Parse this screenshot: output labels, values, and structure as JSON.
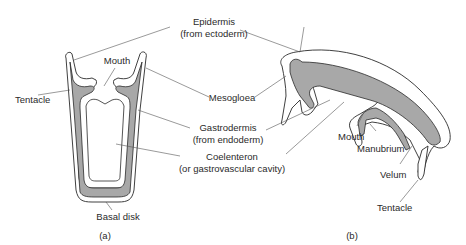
{
  "figure": {
    "panel_a": {
      "caption": "(a)",
      "labels": {
        "tentacle": "Tentacle",
        "mouth": "Mouth",
        "basal_disk": "Basal disk"
      }
    },
    "panel_b": {
      "caption": "(b)",
      "labels": {
        "mouth": "Mouth",
        "manubrium": "Manubrium",
        "velum": "Velum",
        "tentacle": "Tentacle"
      }
    },
    "shared_labels": {
      "epidermis_line1": "Epidermis",
      "epidermis_line2": "(from ectoderm)",
      "mesogloea": "Mesogloea",
      "gastrodermis_line1": "Gastrodermis",
      "gastrodermis_line2": "(from endoderm)",
      "coelenteron_line1": "Coelenteron",
      "coelenteron_line2": "(or gastrovascular cavity)"
    },
    "colors": {
      "gastrodermis_fill": "#a8a8a8",
      "outline": "#2a2a2a",
      "background": "#ffffff"
    }
  }
}
